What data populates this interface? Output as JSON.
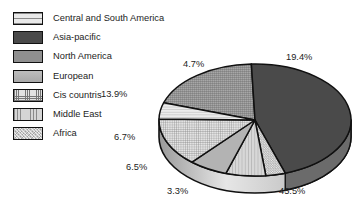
{
  "chart_data": {
    "type": "pie",
    "title": "",
    "legend_position": "left",
    "three_d": true,
    "categories": [
      "Central and South America",
      "Asia-pacific",
      "North America",
      "European",
      "Cis countris",
      "Middle East",
      "Africa"
    ],
    "values": [
      4.7,
      45.5,
      19.4,
      6.5,
      13.9,
      6.7,
      3.3
    ],
    "value_labels": [
      "4.7%",
      "45.5%",
      "19.4%",
      "6.5%",
      "13.9%",
      "6.7%",
      "3.3%"
    ],
    "unit": "%",
    "total": 100.0,
    "slices": [
      {
        "label": "North America",
        "value": 19.4,
        "display": "19.4%",
        "pattern": "pat-dots-mid",
        "color": "#8f8f8f"
      },
      {
        "label": "Asia-pacific",
        "value": 45.5,
        "display": "45.5%",
        "pattern": "pat-solid-dark",
        "color": "#4a4a4a"
      },
      {
        "label": "Africa",
        "value": 3.3,
        "display": "3.3%",
        "pattern": "pat-speckle",
        "color": "#c9c9c9"
      },
      {
        "label": "Middle East",
        "value": 6.7,
        "display": "6.7%",
        "pattern": "pat-vlines",
        "color": "#d5d5d5"
      },
      {
        "label": "European",
        "value": 6.5,
        "display": "6.5%",
        "pattern": "pat-flat-mid",
        "color": "#b3b3b3"
      },
      {
        "label": "Cis countris",
        "value": 13.9,
        "display": "13.9%",
        "pattern": "pat-grid-fine",
        "color": "#e2e2e2"
      },
      {
        "label": "Central and South America",
        "value": 4.7,
        "display": "4.7%",
        "pattern": "pat-hlines-light",
        "color": "#e9e9e9"
      }
    ]
  },
  "legend": {
    "items": [
      {
        "label": "Central and South America",
        "pattern": "pat-hlines-light"
      },
      {
        "label": "Asia-pacific",
        "pattern": "pat-solid-dark"
      },
      {
        "label": "North America",
        "pattern": "pat-dots-mid"
      },
      {
        "label": "European",
        "pattern": "pat-flat-mid"
      },
      {
        "label": "Cis countris",
        "pattern": "pat-grid-fine"
      },
      {
        "label": "Middle East",
        "pattern": "pat-vlines"
      },
      {
        "label": "Africa",
        "pattern": "pat-speckle"
      }
    ]
  },
  "labels": [
    {
      "text": "19.4%",
      "left": 286,
      "top": 53
    },
    {
      "text": "4.7%",
      "left": 183,
      "top": 60
    },
    {
      "text": "13.9%",
      "left": 101,
      "top": 90
    },
    {
      "text": "6.7%",
      "left": 114,
      "top": 133
    },
    {
      "text": "6.5%",
      "left": 126,
      "top": 163
    },
    {
      "text": "3.3%",
      "left": 167,
      "top": 187
    },
    {
      "text": "45.5%",
      "left": 279,
      "top": 187
    }
  ],
  "colors": {
    "background": "#ffffff",
    "outline": "#101010",
    "text": "#1c1c1c",
    "side_wall_light": "#e6e6e6",
    "side_wall_dark": "#9a9a9a"
  }
}
